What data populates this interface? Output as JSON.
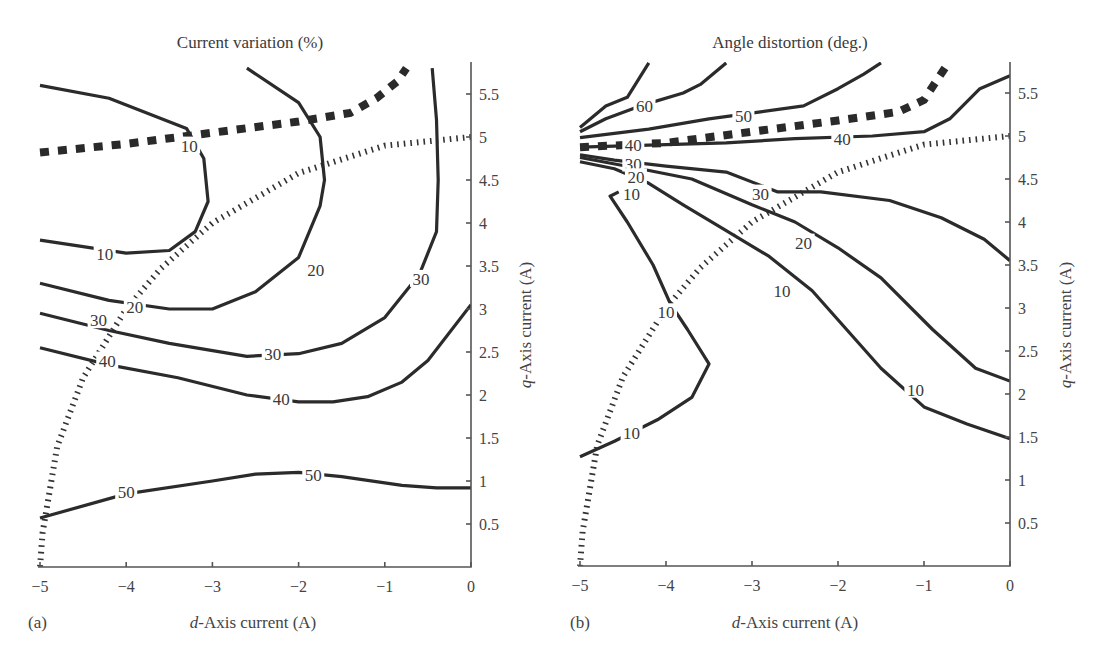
{
  "figure": {
    "panel_a": {
      "label": "(a)",
      "title": "Current variation (%)",
      "xlabel_italic": "d",
      "xlabel_rest": "-Axis current (A)",
      "ylabel_italic": "q",
      "ylabel_rest": "-Axis current (A)",
      "x_ticks": [
        "−5",
        "−4",
        "−3",
        "−2",
        "−1",
        "0"
      ],
      "y_ticks": [
        "0.5",
        "1",
        "1.5",
        "2",
        "2.5",
        "3",
        "3.5",
        "4",
        "4.5",
        "5",
        "5.5"
      ]
    },
    "panel_b": {
      "label": "(b)",
      "title": "Angle distortion (deg.)",
      "xlabel_italic": "d",
      "xlabel_rest": "-Axis current (A)",
      "ylabel_italic": "q",
      "ylabel_rest": "-Axis current (A)",
      "x_ticks": [
        "−5",
        "−4",
        "−3",
        "−2",
        "−1",
        "0"
      ],
      "y_ticks": [
        "0.5",
        "1",
        "1.5",
        "2",
        "2.5",
        "3",
        "3.5",
        "4",
        "4.5",
        "5",
        "5.5"
      ]
    }
  },
  "chart_data": [
    {
      "type": "contour",
      "title": "Current variation (%)",
      "panel": "(a)",
      "xlabel": "d-Axis current (A)",
      "ylabel": "q-Axis current (A)",
      "xlim": [
        -5,
        0
      ],
      "ylim": [
        0,
        5.8
      ],
      "x_ticks": [
        -5,
        -4,
        -3,
        -2,
        -1,
        0
      ],
      "y_ticks": [
        0.5,
        1,
        1.5,
        2,
        2.5,
        3,
        3.5,
        4,
        4.5,
        5,
        5.5
      ],
      "grid": false,
      "contour_levels": [
        10,
        20,
        30,
        40,
        50
      ],
      "contours": [
        {
          "level": 10,
          "points": [
            [
              -5,
              5.6
            ],
            [
              -4.2,
              5.45
            ],
            [
              -3.3,
              5.1
            ],
            [
              -3.1,
              4.75
            ],
            [
              -3.05,
              4.25
            ],
            [
              -3.2,
              3.9
            ],
            [
              -3.5,
              3.68
            ],
            [
              -4.0,
              3.65
            ],
            [
              -5,
              3.8
            ]
          ]
        },
        {
          "level": 20,
          "points": [
            [
              -2.6,
              5.8
            ],
            [
              -2.0,
              5.4
            ],
            [
              -1.75,
              5.0
            ],
            [
              -1.7,
              4.5
            ],
            [
              -1.75,
              4.2
            ],
            [
              -2.0,
              3.6
            ],
            [
              -2.5,
              3.2
            ],
            [
              -3.0,
              3.0
            ],
            [
              -3.5,
              3.0
            ],
            [
              -4.2,
              3.1
            ],
            [
              -5,
              3.3
            ]
          ]
        },
        {
          "level": 30,
          "points": [
            [
              -0.45,
              5.8
            ],
            [
              -0.4,
              5.2
            ],
            [
              -0.38,
              4.5
            ],
            [
              -0.4,
              3.9
            ],
            [
              -0.6,
              3.4
            ],
            [
              -1.0,
              2.9
            ],
            [
              -1.5,
              2.6
            ],
            [
              -2.0,
              2.48
            ],
            [
              -2.6,
              2.45
            ],
            [
              -3.5,
              2.6
            ],
            [
              -4.2,
              2.75
            ],
            [
              -5,
              2.95
            ]
          ]
        },
        {
          "level": 40,
          "points": [
            [
              0,
              3.05
            ],
            [
              -0.5,
              2.4
            ],
            [
              -0.8,
              2.15
            ],
            [
              -1.2,
              1.98
            ],
            [
              -1.6,
              1.92
            ],
            [
              -2.0,
              1.92
            ],
            [
              -2.6,
              2.0
            ],
            [
              -3.4,
              2.2
            ],
            [
              -4.2,
              2.35
            ],
            [
              -5,
              2.55
            ]
          ]
        },
        {
          "level": 50,
          "points": [
            [
              0,
              0.92
            ],
            [
              -0.4,
              0.92
            ],
            [
              -0.8,
              0.95
            ],
            [
              -1.5,
              1.05
            ],
            [
              -2.0,
              1.1
            ],
            [
              -2.5,
              1.08
            ],
            [
              -3.0,
              1.0
            ],
            [
              -4.0,
              0.85
            ],
            [
              -5,
              0.57
            ]
          ]
        }
      ],
      "overlays": [
        {
          "name": "MTPA trajectory",
          "style": "thick dashed",
          "points": [
            [
              -5,
              4.82
            ],
            [
              -4.0,
              4.92
            ],
            [
              -3.0,
              5.05
            ],
            [
              -2.0,
              5.18
            ],
            [
              -1.4,
              5.28
            ],
            [
              -1.1,
              5.45
            ],
            [
              -0.85,
              5.65
            ],
            [
              -0.75,
              5.8
            ]
          ]
        },
        {
          "name": "Current limit circle",
          "style": "dotted",
          "points": [
            [
              0,
              5.0
            ],
            [
              -1.0,
              4.9
            ],
            [
              -2.0,
              4.58
            ],
            [
              -3.0,
              4.0
            ],
            [
              -3.6,
              3.47
            ],
            [
              -4.0,
              3.0
            ],
            [
              -4.5,
              2.2
            ],
            [
              -4.8,
              1.4
            ],
            [
              -4.97,
              0.4
            ],
            [
              -5.0,
              0.0
            ]
          ]
        }
      ],
      "contour_label_positions": [
        {
          "text": "10",
          "x": -3.27,
          "y": 4.9
        },
        {
          "text": "10",
          "x": -4.25,
          "y": 3.64
        },
        {
          "text": "20",
          "x": -3.9,
          "y": 3.02
        },
        {
          "text": "20",
          "x": -1.8,
          "y": 3.45
        },
        {
          "text": "30",
          "x": -4.32,
          "y": 2.87
        },
        {
          "text": "30",
          "x": -2.3,
          "y": 2.48
        },
        {
          "text": "30",
          "x": -0.58,
          "y": 3.35
        },
        {
          "text": "40",
          "x": -4.22,
          "y": 2.4
        },
        {
          "text": "40",
          "x": -2.2,
          "y": 1.95
        },
        {
          "text": "50",
          "x": -4.0,
          "y": 0.87
        },
        {
          "text": "50",
          "x": -1.83,
          "y": 1.07
        }
      ]
    },
    {
      "type": "contour",
      "title": "Angle distortion (deg.)",
      "panel": "(b)",
      "xlabel": "d-Axis current (A)",
      "ylabel": "q-Axis current (A)",
      "xlim": [
        -5,
        0
      ],
      "ylim": [
        0,
        5.8
      ],
      "x_ticks": [
        -5,
        -4,
        -3,
        -2,
        -1,
        0
      ],
      "y_ticks": [
        0.5,
        1,
        1.5,
        2,
        2.5,
        3,
        3.5,
        4,
        4.5,
        5,
        5.5
      ],
      "grid": false,
      "contour_levels": [
        10,
        20,
        30,
        40,
        50,
        60
      ],
      "contours": [
        {
          "level": 60,
          "points": [
            [
              -4.2,
              5.85
            ],
            [
              -4.45,
              5.45
            ],
            [
              -4.7,
              5.35
            ],
            [
              -5.0,
              5.1
            ]
          ]
        },
        {
          "level": 60,
          "points": [
            [
              -3.3,
              5.85
            ],
            [
              -3.6,
              5.6
            ],
            [
              -3.8,
              5.5
            ],
            [
              -4.3,
              5.35
            ],
            [
              -4.7,
              5.2
            ],
            [
              -5.0,
              5.05
            ]
          ]
        },
        {
          "level": 50,
          "points": [
            [
              -1.5,
              5.85
            ],
            [
              -1.7,
              5.72
            ],
            [
              -2.0,
              5.55
            ],
            [
              -2.4,
              5.35
            ],
            [
              -2.9,
              5.28
            ],
            [
              -3.5,
              5.2
            ],
            [
              -4.2,
              5.08
            ],
            [
              -5.0,
              4.98
            ]
          ]
        },
        {
          "level": 40,
          "points": [
            [
              0,
              5.7
            ],
            [
              -0.35,
              5.55
            ],
            [
              -0.7,
              5.2
            ],
            [
              -1.0,
              5.05
            ],
            [
              -1.6,
              5.0
            ],
            [
              -2.5,
              4.97
            ],
            [
              -3.3,
              4.92
            ],
            [
              -4.0,
              4.9
            ],
            [
              -5.0,
              4.87
            ]
          ]
        },
        {
          "level": 30,
          "points": [
            [
              0,
              3.55
            ],
            [
              -0.3,
              3.8
            ],
            [
              -0.8,
              4.05
            ],
            [
              -1.4,
              4.25
            ],
            [
              -2.2,
              4.35
            ],
            [
              -2.7,
              4.35
            ],
            [
              -3.3,
              4.58
            ],
            [
              -4.0,
              4.65
            ],
            [
              -4.6,
              4.72
            ],
            [
              -5.0,
              4.78
            ]
          ]
        },
        {
          "level": 20,
          "points": [
            [
              0,
              2.15
            ],
            [
              -0.4,
              2.3
            ],
            [
              -0.9,
              2.75
            ],
            [
              -1.5,
              3.35
            ],
            [
              -2.0,
              3.7
            ],
            [
              -2.5,
              4.0
            ],
            [
              -3.0,
              4.2
            ],
            [
              -3.7,
              4.5
            ],
            [
              -4.3,
              4.62
            ],
            [
              -5.0,
              4.75
            ]
          ]
        },
        {
          "level": 10,
          "points": [
            [
              0,
              1.48
            ],
            [
              -0.5,
              1.65
            ],
            [
              -1.0,
              1.85
            ],
            [
              -1.5,
              2.3
            ],
            [
              -1.9,
              2.75
            ],
            [
              -2.3,
              3.2
            ],
            [
              -2.8,
              3.6
            ],
            [
              -3.3,
              3.9
            ],
            [
              -3.8,
              4.2
            ],
            [
              -4.2,
              4.45
            ],
            [
              -4.6,
              4.62
            ],
            [
              -5.0,
              4.7
            ]
          ]
        },
        {
          "level": 10,
          "points": [
            [
              -5.0,
              1.27
            ],
            [
              -4.6,
              1.45
            ],
            [
              -4.1,
              1.7
            ],
            [
              -3.7,
              1.96
            ],
            [
              -3.5,
              2.35
            ],
            [
              -3.75,
              2.75
            ],
            [
              -3.95,
              3.05
            ],
            [
              -4.15,
              3.5
            ],
            [
              -4.45,
              4.0
            ],
            [
              -4.65,
              4.3
            ],
            [
              -4.55,
              4.35
            ]
          ]
        }
      ],
      "overlays": [
        {
          "name": "MTPA trajectory",
          "style": "thick dashed",
          "points": [
            [
              -5,
              4.87
            ],
            [
              -4.0,
              4.92
            ],
            [
              -3.0,
              5.05
            ],
            [
              -2.0,
              5.18
            ],
            [
              -1.3,
              5.28
            ],
            [
              -1.0,
              5.42
            ],
            [
              -0.85,
              5.65
            ],
            [
              -0.75,
              5.8
            ]
          ]
        },
        {
          "name": "Current limit circle",
          "style": "dotted",
          "points": [
            [
              0,
              5.0
            ],
            [
              -1.0,
              4.9
            ],
            [
              -2.0,
              4.58
            ],
            [
              -3.0,
              4.0
            ],
            [
              -3.6,
              3.47
            ],
            [
              -4.0,
              3.0
            ],
            [
              -4.5,
              2.2
            ],
            [
              -4.8,
              1.4
            ],
            [
              -4.97,
              0.4
            ],
            [
              -5.0,
              0.0
            ]
          ]
        }
      ],
      "contour_label_positions": [
        {
          "text": "60",
          "x": -4.25,
          "y": 5.35
        },
        {
          "text": "50",
          "x": -3.1,
          "y": 5.23
        },
        {
          "text": "40",
          "x": -4.38,
          "y": 4.9
        },
        {
          "text": "40",
          "x": -1.95,
          "y": 4.97
        },
        {
          "text": "30",
          "x": -4.38,
          "y": 4.68
        },
        {
          "text": "30",
          "x": -2.9,
          "y": 4.33
        },
        {
          "text": "20",
          "x": -4.35,
          "y": 4.52
        },
        {
          "text": "20",
          "x": -2.4,
          "y": 3.76
        },
        {
          "text": "10",
          "x": -4.4,
          "y": 4.32
        },
        {
          "text": "10",
          "x": -2.65,
          "y": 3.2
        },
        {
          "text": "10",
          "x": -4.0,
          "y": 2.95
        },
        {
          "text": "10",
          "x": -4.4,
          "y": 1.55
        },
        {
          "text": "10",
          "x": -1.1,
          "y": 2.05
        }
      ]
    }
  ]
}
